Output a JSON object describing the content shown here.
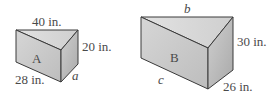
{
  "figures": [
    {
      "name": "A",
      "labels": {
        "top": "40 in.",
        "right": "20 in.",
        "bottom_left": "28 in.",
        "bottom_right": "a"
      }
    },
    {
      "name": "B",
      "labels": {
        "top": "b",
        "right": "30 in.",
        "bottom_left": "c",
        "bottom_right": "26 in."
      }
    }
  ],
  "colors": {
    "front": "#c9c9c9",
    "top": "#dcdcdc",
    "side": "#b5b5b5",
    "edge": "#3a3a3a"
  }
}
